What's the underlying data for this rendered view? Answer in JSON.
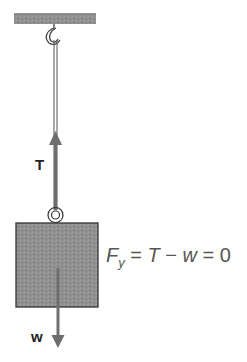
{
  "diagram": {
    "labels": {
      "tension": "T",
      "weight": "w"
    },
    "equation": {
      "lhs_symbol": "F",
      "lhs_subscript": "y",
      "eq1": " = ",
      "t": "T",
      "minus": " − ",
      "w": "w",
      "eq2": " = ",
      "rhs": "0"
    },
    "colors": {
      "ceiling": "#9a9a9a",
      "block": "#8c8c8c",
      "arrow": "#6e6e6e",
      "outline": "#333333"
    }
  }
}
